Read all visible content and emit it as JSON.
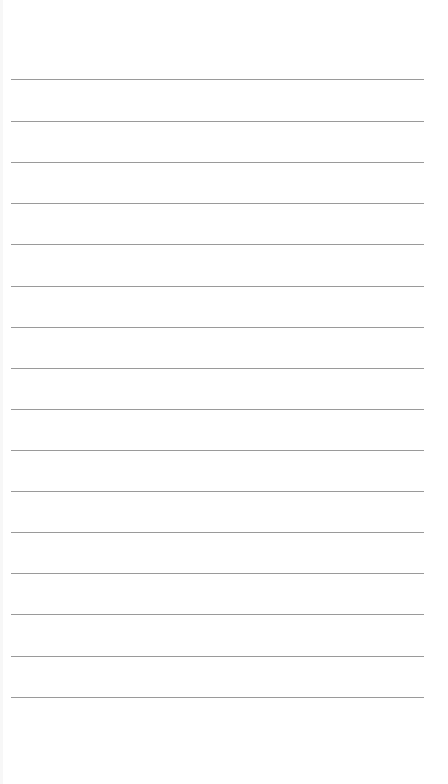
{
  "page": {
    "background": "#ffffff",
    "line_color": "#9a9a9a"
  },
  "notepad": {
    "line_count": 16,
    "line_positions_y": [
      79,
      121,
      162,
      203,
      244,
      286,
      327,
      368,
      409,
      450,
      491,
      532,
      573,
      614,
      656,
      697
    ],
    "lines": [
      "",
      "",
      "",
      "",
      "",
      "",
      "",
      "",
      "",
      "",
      "",
      "",
      "",
      "",
      "",
      ""
    ]
  }
}
